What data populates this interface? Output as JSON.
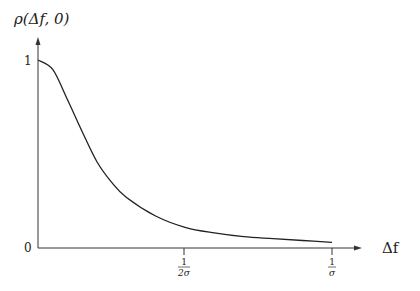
{
  "chart_data": {
    "type": "line",
    "title": "",
    "xlabel": "Δf",
    "ylabel": "ρ(Δf, 0)",
    "x_ticks": [
      {
        "num": "1",
        "den": "2σ",
        "value": 0.5
      },
      {
        "num": "1",
        "den": "σ",
        "value": 1.0
      }
    ],
    "y_ticks": [
      {
        "label": "0",
        "value": 0
      },
      {
        "label": "1",
        "value": 1
      }
    ],
    "xlim": [
      0,
      1.0
    ],
    "ylim": [
      0,
      1
    ],
    "grid": false,
    "legend": null,
    "series": [
      {
        "name": "ρ(Δf, 0)",
        "x": [
          0,
          0.05,
          0.1,
          0.15,
          0.2,
          0.25,
          0.3,
          0.4,
          0.5,
          0.6,
          0.7,
          0.8,
          0.9,
          1.0
        ],
        "values": [
          1.0,
          0.95,
          0.79,
          0.62,
          0.46,
          0.35,
          0.27,
          0.17,
          0.11,
          0.08,
          0.06,
          0.05,
          0.04,
          0.03
        ]
      }
    ]
  },
  "labels": {
    "y_axis": "ρ(Δf, 0)",
    "x_axis": "Δf",
    "y_tick_0": "0",
    "y_tick_1": "1",
    "x_tick_half_num": "1",
    "x_tick_half_den": "2σ",
    "x_tick_one_num": "1",
    "x_tick_one_den": "σ"
  }
}
